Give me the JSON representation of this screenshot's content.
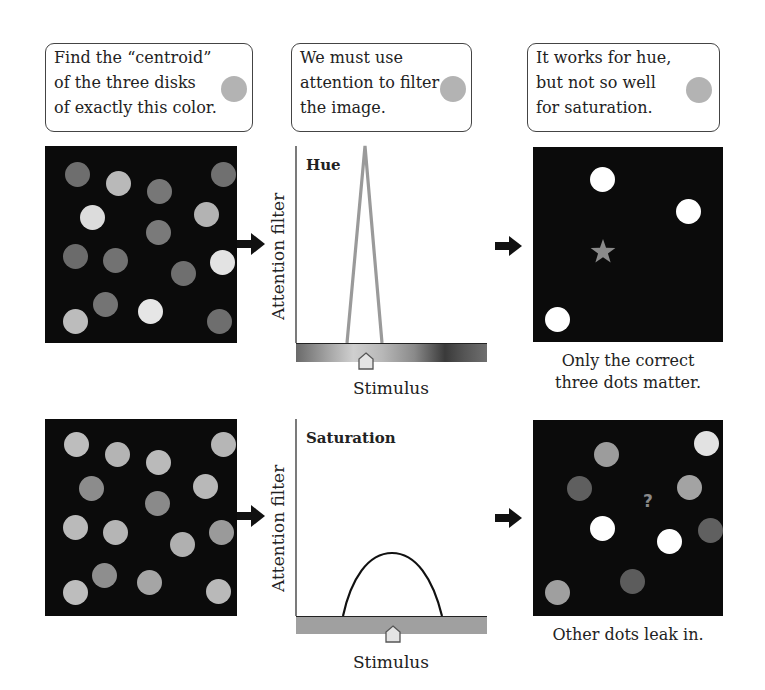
{
  "callouts": [
    {
      "lines": [
        "Find the “centroid”",
        "of the three disks",
        "of exactly this color."
      ],
      "swatch_color": "#b3b3b3"
    },
    {
      "lines": [
        "We must use",
        "attention to filter",
        "the image."
      ],
      "swatch_color": "#b3b3b3"
    },
    {
      "lines": [
        "It works for hue,",
        "but not so well",
        "for saturation."
      ],
      "swatch_color": "#b3b3b3"
    }
  ],
  "rows": [
    {
      "input_panel": {
        "background": "#0b0b0b",
        "dots": [
          {
            "x": 32,
            "y": 28,
            "color": "#6e6e6e"
          },
          {
            "x": 73,
            "y": 37,
            "color": "#b9b9b9"
          },
          {
            "x": 114,
            "y": 45,
            "color": "#777777"
          },
          {
            "x": 178,
            "y": 28,
            "color": "#707070"
          },
          {
            "x": 47,
            "y": 71,
            "color": "#dcdcdc"
          },
          {
            "x": 161,
            "y": 68,
            "color": "#b3b3b3"
          },
          {
            "x": 113,
            "y": 86,
            "color": "#7a7a7a"
          },
          {
            "x": 30,
            "y": 110,
            "color": "#6b6b6b"
          },
          {
            "x": 70,
            "y": 114,
            "color": "#727272"
          },
          {
            "x": 177,
            "y": 116,
            "color": "#e3e3e3"
          },
          {
            "x": 138,
            "y": 127,
            "color": "#6f6f6f"
          },
          {
            "x": 60,
            "y": 158,
            "color": "#747474"
          },
          {
            "x": 105,
            "y": 165,
            "color": "#e6e6e6"
          },
          {
            "x": 30,
            "y": 175,
            "color": "#bcbcbc"
          },
          {
            "x": 174,
            "y": 175,
            "color": "#6e6e6e"
          }
        ]
      },
      "chart": {
        "title": "Hue",
        "ylabel": "Attention filter",
        "xlabel": "Stimulus",
        "curve": "triangle",
        "curve_color": "#9a9a9a",
        "bar_style": "hue_gradient",
        "marker_position": 0.37
      },
      "output_panel": {
        "background": "#0b0b0b",
        "dots": [
          {
            "x": 69,
            "y": 32,
            "color": "#ffffff"
          },
          {
            "x": 155,
            "y": 64,
            "color": "#ffffff"
          },
          {
            "x": 24,
            "y": 172,
            "color": "#ffffff"
          }
        ],
        "marker": {
          "type": "star",
          "x": 70,
          "y": 105,
          "color": "#8a8a8a"
        },
        "caption": [
          "Only the correct",
          "three dots matter."
        ]
      }
    },
    {
      "input_panel": {
        "background": "#0b0b0b",
        "dots": [
          {
            "x": 31,
            "y": 25,
            "color": "#bdbdbd"
          },
          {
            "x": 72,
            "y": 35,
            "color": "#b4b4b4"
          },
          {
            "x": 113,
            "y": 43,
            "color": "#bababa"
          },
          {
            "x": 178,
            "y": 25,
            "color": "#b6b6b6"
          },
          {
            "x": 46,
            "y": 69,
            "color": "#8c8c8c"
          },
          {
            "x": 160,
            "y": 67,
            "color": "#b8b8b8"
          },
          {
            "x": 112,
            "y": 84,
            "color": "#8a8a8a"
          },
          {
            "x": 30,
            "y": 108,
            "color": "#bababa"
          },
          {
            "x": 70,
            "y": 113,
            "color": "#b5b5b5"
          },
          {
            "x": 176,
            "y": 113,
            "color": "#9a9a9a"
          },
          {
            "x": 137,
            "y": 125,
            "color": "#b0b0b0"
          },
          {
            "x": 59,
            "y": 156,
            "color": "#8e8e8e"
          },
          {
            "x": 104,
            "y": 163,
            "color": "#a5a5a5"
          },
          {
            "x": 30,
            "y": 173,
            "color": "#bdbdbd"
          },
          {
            "x": 173,
            "y": 172,
            "color": "#b9b9b9"
          }
        ]
      },
      "chart": {
        "title": "Saturation",
        "ylabel": "Attention filter",
        "xlabel": "Stimulus",
        "curve": "arch",
        "curve_color": "#111111",
        "bar_style": "saturation_flat",
        "marker_position": 0.5
      },
      "output_panel": {
        "background": "#0b0b0b",
        "dots": [
          {
            "x": 73,
            "y": 34,
            "color": "#9c9c9c"
          },
          {
            "x": 173,
            "y": 23,
            "color": "#e2e2e2"
          },
          {
            "x": 46,
            "y": 68,
            "color": "#5f5f5f"
          },
          {
            "x": 156,
            "y": 67,
            "color": "#a3a3a3"
          },
          {
            "x": 69,
            "y": 108,
            "color": "#ffffff"
          },
          {
            "x": 136,
            "y": 121,
            "color": "#ffffff"
          },
          {
            "x": 177,
            "y": 110,
            "color": "#606060"
          },
          {
            "x": 99,
            "y": 161,
            "color": "#5c5c5c"
          },
          {
            "x": 24,
            "y": 172,
            "color": "#9f9f9f"
          }
        ],
        "marker": {
          "type": "question",
          "symbol": "?",
          "x": 116,
          "y": 82,
          "color": "#8a8a8a"
        },
        "caption": [
          "Other dots leak in."
        ]
      }
    }
  ]
}
